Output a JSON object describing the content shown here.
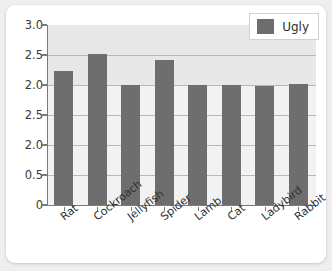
{
  "chart_data": {
    "type": "bar",
    "title": "",
    "xlabel": "",
    "ylabel": "",
    "categories": [
      "Rat",
      "Cockroach",
      "Jellyfish",
      "Spider",
      "Lamb",
      "Cat",
      "Ladybird",
      "Rabbit"
    ],
    "series": [
      {
        "name": "Ugly",
        "values": [
          2.23,
          2.52,
          2.0,
          2.42,
          2.0,
          2.0,
          1.98,
          2.01
        ]
      }
    ],
    "ytick_labels": [
      "3.0",
      "2.5",
      "2.0",
      "2.5",
      "2.0",
      "0.5",
      "0"
    ],
    "ytick_positions": [
      3.0,
      2.5,
      2.0,
      1.5,
      1.0,
      0.5,
      0.0
    ],
    "ylim": [
      0,
      3.0
    ],
    "grid": true,
    "legend": {
      "entries": [
        "Ugly"
      ],
      "position": "top-right"
    },
    "colors": {
      "bar": "#6e6e6e",
      "plot_background": "#f2f2f2",
      "band_top": "#e8e8e8",
      "gridline": "#b8b8b8",
      "axis": "#7a7a7a",
      "card": "#ffffff",
      "page_background": "#efefef",
      "text": "#2f2f2f"
    }
  }
}
